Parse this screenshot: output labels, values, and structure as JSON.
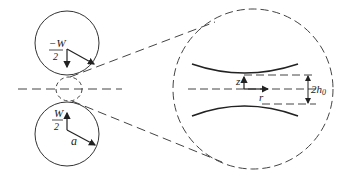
{
  "diagram": {
    "title": "",
    "labels": {
      "top_load_num": "−W",
      "top_load_den": "2",
      "bottom_load_num": "W",
      "bottom_load_den": "2",
      "radius": "a",
      "z_axis": "z",
      "r_axis": "r",
      "gap": "2h",
      "gap_sub": "0"
    },
    "colors": {
      "stroke": "#333333",
      "dash": "#444444",
      "background": "#ffffff"
    }
  }
}
